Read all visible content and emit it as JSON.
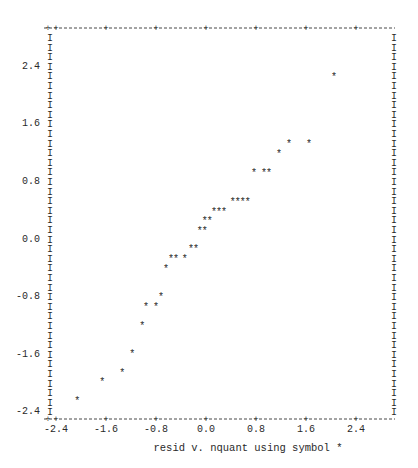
{
  "chart_data": {
    "type": "scatter",
    "title": "",
    "caption": "resid  v. nquant using symbol *",
    "xlabel": "nquant",
    "ylabel": "resid",
    "symbol": "*",
    "xlim": [
      -2.4,
      3.0
    ],
    "ylim": [
      -2.5,
      2.9
    ],
    "x_ticks": [
      -2.4,
      -1.6,
      -0.8,
      0.0,
      0.8,
      1.6,
      2.4
    ],
    "x_tick_labels": [
      "-2.4",
      "-1.6",
      "-0.8",
      "0.0",
      "0.8",
      "1.6",
      "2.4"
    ],
    "y_ticks": [
      2.4,
      1.6,
      0.8,
      0.0,
      -0.8,
      -1.6,
      -2.4
    ],
    "y_tick_labels": [
      "2.4",
      "1.6",
      "0.8",
      "0.0",
      "-0.8",
      "-1.6",
      "-2.4"
    ],
    "grid": false,
    "legend": null,
    "points": [
      {
        "x": -2.06,
        "y": -2.24
      },
      {
        "x": -1.66,
        "y": -1.97
      },
      {
        "x": -1.34,
        "y": -1.85
      },
      {
        "x": -1.18,
        "y": -1.59
      },
      {
        "x": -1.02,
        "y": -1.2
      },
      {
        "x": -0.96,
        "y": -0.93
      },
      {
        "x": -0.8,
        "y": -0.93
      },
      {
        "x": -0.72,
        "y": -0.79
      },
      {
        "x": -0.64,
        "y": -0.4
      },
      {
        "x": -0.56,
        "y": -0.26
      },
      {
        "x": -0.48,
        "y": -0.26
      },
      {
        "x": -0.34,
        "y": -0.26
      },
      {
        "x": -0.24,
        "y": -0.13
      },
      {
        "x": -0.16,
        "y": -0.13
      },
      {
        "x": -0.1,
        "y": 0.13
      },
      {
        "x": -0.02,
        "y": 0.13
      },
      {
        "x": -0.02,
        "y": 0.26
      },
      {
        "x": 0.06,
        "y": 0.26
      },
      {
        "x": 0.13,
        "y": 0.39
      },
      {
        "x": 0.21,
        "y": 0.39
      },
      {
        "x": 0.29,
        "y": 0.39
      },
      {
        "x": 0.43,
        "y": 0.53
      },
      {
        "x": 0.51,
        "y": 0.53
      },
      {
        "x": 0.59,
        "y": 0.53
      },
      {
        "x": 0.67,
        "y": 0.53
      },
      {
        "x": 0.77,
        "y": 0.93
      },
      {
        "x": 0.93,
        "y": 0.93
      },
      {
        "x": 1.01,
        "y": 0.93
      },
      {
        "x": 1.17,
        "y": 1.2
      },
      {
        "x": 1.33,
        "y": 1.34
      },
      {
        "x": 1.65,
        "y": 1.34
      },
      {
        "x": 2.05,
        "y": 2.27
      }
    ]
  },
  "frame": {
    "left_px": 50,
    "right_px": 395,
    "top_px": 28,
    "bottom_px": 419,
    "x_zero_px": 206,
    "x_px_per_unit": 62.5,
    "y_zero_px": 238,
    "y_px_per_unit": 71.9,
    "row_step_px": 9.6
  },
  "glyphs": {
    "border_char": "I",
    "tick_char": "+",
    "point_char": "*"
  }
}
